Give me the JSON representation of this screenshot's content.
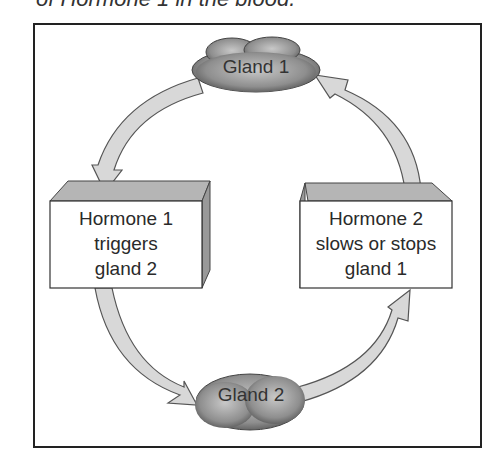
{
  "caption": "of Hormone 1 in the blood.",
  "diagram": {
    "nodes": {
      "gland1": {
        "label": "Gland 1"
      },
      "gland2": {
        "label": "Gland 2"
      },
      "box_left": {
        "lines": [
          "Hormone 1",
          "triggers",
          "gland 2"
        ]
      },
      "box_right": {
        "lines": [
          "Hormone 2",
          "slows or stops",
          "gland 1"
        ]
      }
    },
    "arrows": [
      {
        "from": "gland1",
        "to": "box_left"
      },
      {
        "from": "box_left",
        "to": "gland2"
      },
      {
        "from": "gland2",
        "to": "box_right"
      },
      {
        "from": "box_right",
        "to": "gland1"
      }
    ],
    "colors": {
      "gland_fill": "#8a8a8a",
      "arrow_fill": "#d8d8d8",
      "box_top": "#b5b5b5",
      "frame": "#222222"
    }
  }
}
